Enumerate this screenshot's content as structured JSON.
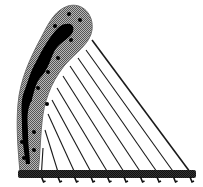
{
  "image": {
    "subject": "harp",
    "description": "Black-and-white illustration of a harp with a curved dotted neck, diagonal strings and a base soundboard with tuning pegs",
    "string_count": 10,
    "peg_count": 10,
    "colors": {
      "background": "#ffffff",
      "neck_fill": "#9a9a9a",
      "neck_outline": "#6e6e6e",
      "neck_core": "#000000",
      "dots": "#000000",
      "strings": "#1a1a1a",
      "base": "#2b2b2b"
    }
  }
}
